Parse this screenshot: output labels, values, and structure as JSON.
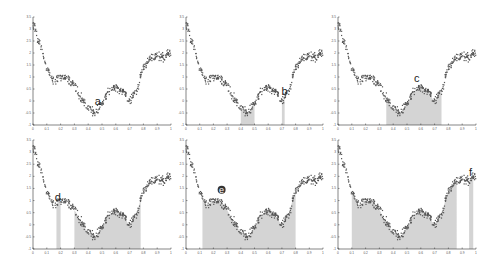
{
  "chart_data": {
    "type": "scatter",
    "title": "",
    "layout": {
      "rows": 2,
      "cols": 3,
      "grid": false,
      "legend": "none"
    },
    "xlabel": "",
    "ylabel": "",
    "xlim": [
      0,
      1
    ],
    "ylim": [
      -1,
      3.5
    ],
    "x_ticks": [
      "0",
      "0.1",
      "0.2",
      "0.3",
      "0.4",
      "0.5",
      "0.6",
      "0.7",
      "0.8",
      "0.9",
      "1"
    ],
    "y_ticks": [
      "-1",
      "-0.5",
      "0",
      "0.5",
      "1",
      "1.5",
      "2",
      "2.5",
      "3",
      "3.5"
    ],
    "underlying_curve": {
      "description": "noisy samples of a wavy function",
      "x": [
        0.0,
        0.05,
        0.1,
        0.15,
        0.2,
        0.25,
        0.3,
        0.35,
        0.4,
        0.45,
        0.5,
        0.55,
        0.6,
        0.65,
        0.7,
        0.75,
        0.8,
        0.85,
        0.9,
        0.95,
        1.0
      ],
      "y": [
        3.2,
        2.4,
        1.4,
        0.8,
        1.0,
        0.95,
        0.6,
        0.1,
        -0.3,
        -0.5,
        -0.1,
        0.4,
        0.6,
        0.4,
        0.0,
        0.5,
        1.4,
        1.8,
        1.9,
        1.85,
        2.0
      ]
    },
    "panels": [
      {
        "label": "a",
        "shaded_intervals": [],
        "label_pos": [
          0.47,
          -0.15
        ]
      },
      {
        "label": "b",
        "shaded_intervals": [
          [
            0.4,
            0.5
          ],
          [
            0.7,
            0.72
          ]
        ],
        "label_pos": [
          0.72,
          0.25
        ]
      },
      {
        "label": "c",
        "shaded_intervals": [
          [
            0.35,
            0.75
          ]
        ],
        "label_pos": [
          0.57,
          0.8
        ]
      },
      {
        "label": "d",
        "shaded_intervals": [
          [
            0.17,
            0.2
          ],
          [
            0.3,
            0.78
          ]
        ],
        "label_pos": [
          0.18,
          1.0
        ]
      },
      {
        "label": "e",
        "shaded_intervals": [
          [
            0.12,
            0.8
          ]
        ],
        "label_pos": [
          0.26,
          1.3
        ],
        "marker": "circle"
      },
      {
        "label": "f",
        "shaded_intervals": [
          [
            0.1,
            0.86
          ],
          [
            0.95,
            0.98
          ]
        ],
        "label_pos": [
          0.96,
          2.0
        ]
      }
    ]
  },
  "style": {
    "point_color": "#555555",
    "shade_color": "#d4d4d4",
    "axis_color": "#333333"
  }
}
